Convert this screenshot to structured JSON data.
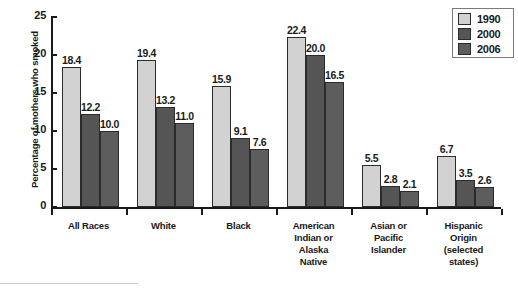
{
  "chart_data": {
    "type": "bar",
    "title": "",
    "xlabel": "",
    "ylabel": "Percentage of mothers who smoked",
    "ylim": [
      0,
      25
    ],
    "yticks": [
      "0",
      "5",
      "10",
      "15",
      "20",
      "25"
    ],
    "grid": false,
    "legend_position": "top-right",
    "categories": [
      "All Races",
      "White",
      "Black",
      "American Indian or Alaska Native",
      "Asian or Pacific Islander",
      "Hispanic Origin (selected states)"
    ],
    "category_lines": [
      [
        "All Races"
      ],
      [
        "White"
      ],
      [
        "Black"
      ],
      [
        "American",
        "Indian or",
        "Alaska",
        "Native"
      ],
      [
        "Asian or",
        "Pacific",
        "Islander"
      ],
      [
        "Hispanic",
        "Origin",
        "(selected",
        "states)"
      ]
    ],
    "series": [
      {
        "name": "1990",
        "color": "#d2d2d2",
        "values": [
          18.4,
          19.4,
          15.9,
          22.4,
          5.5,
          6.7
        ],
        "labels": [
          "18.4",
          "19.4",
          "15.9",
          "22.4",
          "5.5",
          "6.7"
        ]
      },
      {
        "name": "2000",
        "color": "#555555",
        "values": [
          12.2,
          13.2,
          9.1,
          20.0,
          2.8,
          3.5
        ],
        "labels": [
          "12.2",
          "13.2",
          "9.1",
          "20.0",
          "2.8",
          "3.5"
        ]
      },
      {
        "name": "2006",
        "color": "#5d5d5d",
        "values": [
          10.0,
          11.0,
          7.6,
          16.5,
          2.1,
          2.6
        ],
        "labels": [
          "10.0",
          "11.0",
          "7.6",
          "16.5",
          "2.1",
          "2.6"
        ]
      }
    ]
  },
  "legend": {
    "entries": [
      {
        "label": "1990",
        "color": "#d2d2d2"
      },
      {
        "label": "2000",
        "color": "#555555"
      },
      {
        "label": "2006",
        "color": "#5d5d5d"
      }
    ]
  }
}
